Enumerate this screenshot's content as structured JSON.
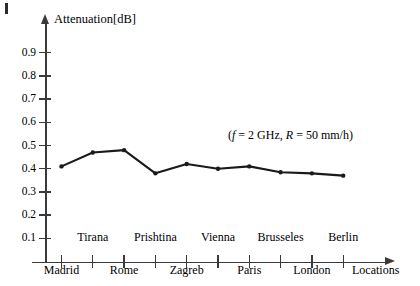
{
  "chart_data": {
    "type": "line",
    "title": "",
    "ylabel": "Attenuation[dB]",
    "xlabel": "Locations",
    "annotation": "(f = 2 GHz, R = 50 mm/h)",
    "annotation_parts": {
      "open": "(",
      "sym_f": "f",
      "eq1": " = 2 GHz, ",
      "sym_R": "R",
      "eq2": " = 50 mm/h)"
    },
    "categories": [
      "Madrid",
      "Tirana",
      "Rome",
      "Prishtina",
      "Zagreb",
      "Vienna",
      "Paris",
      "Brusseles",
      "London",
      "Berlin"
    ],
    "values": [
      0.41,
      0.47,
      0.48,
      0.38,
      0.42,
      0.4,
      0.41,
      0.385,
      0.38,
      0.37
    ],
    "ylim": [
      0,
      1.0
    ],
    "yticks": [
      "0.1",
      "0.2",
      "0.3",
      "0.4",
      "0.5",
      "0.6",
      "0.7",
      "0.8",
      "0.9"
    ],
    "ytick_values": [
      0.1,
      0.2,
      0.3,
      0.4,
      0.5,
      0.6,
      0.7,
      0.8,
      0.9
    ],
    "grid": false,
    "legend": "none",
    "line_color": "#1a1a1a",
    "axis_color": "#3a3a3a",
    "marker": "dot"
  }
}
